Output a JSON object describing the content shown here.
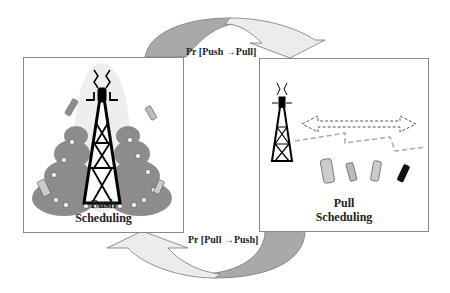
{
  "diagram": {
    "top_arrow": {
      "label": "Pr [Push →Pull]"
    },
    "bottom_arrow": {
      "label": "Pr [Pull →Push]"
    },
    "left_panel": {
      "title_line1": "Push",
      "title_line2": "Scheduling",
      "icons": [
        "broadcast-tower-icon",
        "building-cluster-icon",
        "mobile-phone-icon"
      ]
    },
    "right_panel": {
      "title_line1": "Pull",
      "title_line2": "Scheduling",
      "icons": [
        "broadcast-tower-icon",
        "double-arrow-icon",
        "mobile-phone-icon"
      ]
    },
    "colors": {
      "arrow_dark": "#a9a9a9",
      "arrow_light": "#e8e8e8",
      "border": "#8a8a8a",
      "building": "#8c8c8c"
    }
  }
}
